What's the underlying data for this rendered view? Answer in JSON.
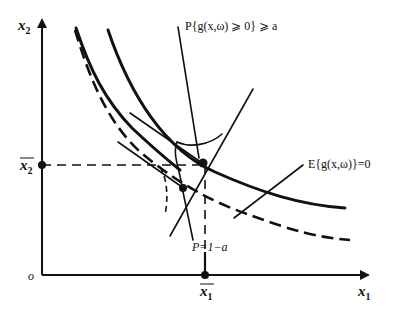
{
  "diagram": {
    "axes": {
      "x_label": "x",
      "x_sub": "1",
      "y_label": "x",
      "y_sub": "2",
      "origin_label": "o"
    },
    "points": {
      "x1_bar": "x",
      "x1_bar_sub": "1",
      "x2_bar": "x",
      "x2_bar_sub": "2"
    },
    "annotations": {
      "probability_constraint": "P{g(x,ω) ⩾ 0} ⩾ a",
      "expected_constraint": "E{g(x,ω)}=0",
      "probability_level": "P=1−a"
    },
    "curves": [
      {
        "name": "expected-value-boundary",
        "style": "solid-thick"
      },
      {
        "name": "inner-expected-boundary",
        "style": "solid-thick"
      },
      {
        "name": "probability-boundary",
        "style": "dashed"
      }
    ]
  }
}
